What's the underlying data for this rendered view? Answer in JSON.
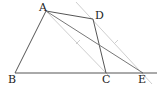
{
  "diagram": {
    "type": "geometry-figure",
    "points": {
      "A": {
        "label": "A",
        "x": 46,
        "y": 11
      },
      "B": {
        "label": "B",
        "x": 15,
        "y": 73
      },
      "C": {
        "label": "C",
        "x": 106,
        "y": 73
      },
      "D": {
        "label": "D",
        "x": 93,
        "y": 19
      },
      "E": {
        "label": "E",
        "x": 143,
        "y": 73
      }
    },
    "segments": [
      "AB",
      "AD",
      "DC",
      "AE",
      "BE"
    ],
    "auxiliary_lines": [
      "A-parallel-to-DE",
      "D-parallel-to-AC"
    ],
    "colors": {
      "main": "#555555",
      "aux": "#cccccc"
    }
  }
}
